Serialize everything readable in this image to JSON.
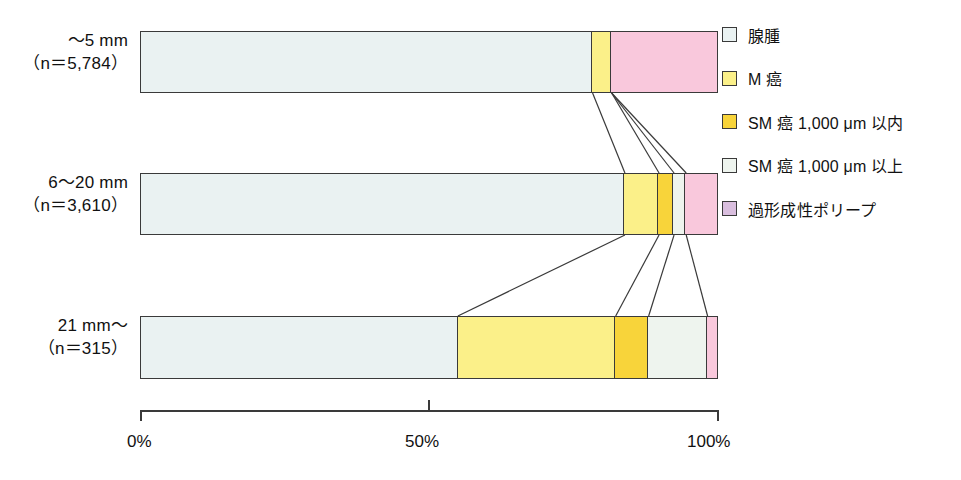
{
  "chart_data": {
    "type": "bar",
    "orientation": "horizontal",
    "stacked": true,
    "normalized": true,
    "title": "",
    "xlabel": "",
    "ylabel": "",
    "xlim": [
      0,
      100
    ],
    "grid": false,
    "legend_position": "right",
    "axis_ticks": [
      "0%",
      "50%",
      "100%"
    ],
    "axis_tick_values": [
      0,
      50,
      100
    ],
    "categories": [
      {
        "line1": "〜5 mm",
        "line2": "（n＝5,784）",
        "n": 5784
      },
      {
        "line1": "6〜20 mm",
        "line2": "（n＝3,610）",
        "n": 3610
      },
      {
        "line1": "21 mm〜",
        "line2": "（n＝315）",
        "n": 315
      }
    ],
    "series": [
      {
        "name": "腺腫",
        "color": "#eaf2f2",
        "values": [
          78.3,
          83.9,
          55.0
        ]
      },
      {
        "name": "M 癌",
        "color": "#fbf089",
        "values": [
          3.3,
          5.9,
          27.3
        ]
      },
      {
        "name": "SM 癌 1,000 μm 以内",
        "color": "#f8d43a",
        "values": [
          0.0,
          2.6,
          5.7
        ]
      },
      {
        "name": "SM 癌 1,000 μm 以上",
        "color": "#eef4ee",
        "values": [
          0.0,
          2.1,
          10.2
        ]
      },
      {
        "name": "過形成性ポリープ",
        "color": "#f9c8dc",
        "values": [
          18.4,
          5.5,
          1.8
        ]
      }
    ],
    "legend": [
      {
        "label": "腺腫",
        "color": "#eaf2f2"
      },
      {
        "label": "M 癌",
        "color": "#fbf089"
      },
      {
        "label": "SM 癌 1,000 μm 以内",
        "color": "#f8d43a"
      },
      {
        "label": "SM 癌 1,000 μm 以上",
        "color": "#eef4ee"
      },
      {
        "label": "過形成性ポリープ",
        "color": "#d9bede"
      }
    ]
  }
}
